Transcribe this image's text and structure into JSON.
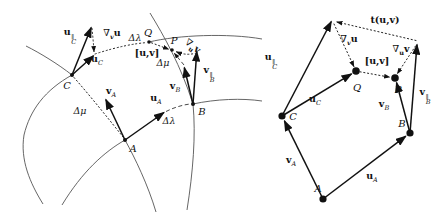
{
  "figure_type": "differential-geometry commutator and torsion construction diagram, two panels",
  "colors": {
    "ink": "#111111",
    "curve": "#555555",
    "background": "#ffffff"
  },
  "sym": {
    "u_par_C": {
      "main": "u",
      "sup": "∥",
      "sub": "C"
    },
    "u_C": {
      "main": "u",
      "sub": "C"
    },
    "u_A": {
      "main": "u",
      "sub": "A"
    },
    "v_A": {
      "main": "v",
      "sub": "A"
    },
    "v_B": {
      "main": "v",
      "sub": "B"
    },
    "v_par_B": {
      "main": "v",
      "sup": "∥",
      "sub": "B"
    },
    "nabla_v_u": {
      "pre": "∇",
      "presub": "v",
      "main": "u"
    },
    "nabla_u_v": {
      "pre": "∇",
      "presub": "u",
      "main": "v"
    },
    "commutator": {
      "main": "[u,v]"
    },
    "torsion": {
      "main": "t(u,v)"
    },
    "delta_lambda": {
      "text": "Δλ"
    },
    "delta_mu": {
      "text": "Δμ"
    },
    "point_A": {
      "text": "A"
    },
    "point_B": {
      "text": "B"
    },
    "point_C": {
      "text": "C"
    },
    "point_P": {
      "text": "P"
    },
    "point_Q": {
      "text": "Q"
    }
  }
}
